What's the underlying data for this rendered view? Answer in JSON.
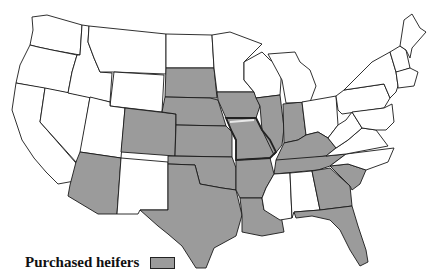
{
  "map": {
    "title": "",
    "region": "Contiguous United States",
    "shaded_fill": "#9b9b9b",
    "unshaded_fill": "#ffffff",
    "highlight_state": "Missouri",
    "shaded_states": [
      "South Dakota",
      "Nebraska",
      "Kansas",
      "Oklahoma",
      "Texas",
      "Colorado",
      "Arizona",
      "Iowa",
      "Missouri",
      "Illinois",
      "Indiana",
      "Kentucky",
      "Tennessee",
      "Arkansas",
      "Louisiana",
      "Georgia",
      "South Carolina",
      "Florida"
    ]
  },
  "legend": {
    "label": "Purchased heifers",
    "swatch_color": "#9b9b9b"
  }
}
